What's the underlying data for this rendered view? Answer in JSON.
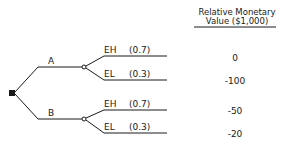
{
  "header": {
    "line1": "Relative Monetary",
    "line2": "Value ($1,000)"
  },
  "decision_node": {
    "shape": "filled-square"
  },
  "alternatives": [
    {
      "label": "A",
      "outcomes": [
        {
          "event": "EH",
          "probability": "(0.7)",
          "value": "0"
        },
        {
          "event": "EL",
          "probability": "(0.3)",
          "value": "-100"
        }
      ]
    },
    {
      "label": "B",
      "outcomes": [
        {
          "event": "EH",
          "probability": "(0.7)",
          "value": "-50"
        },
        {
          "event": "EL",
          "probability": "(0.3)",
          "value": "-20"
        }
      ]
    }
  ],
  "colors": {
    "line": "#1a1a1a",
    "background": "#ffffff"
  }
}
